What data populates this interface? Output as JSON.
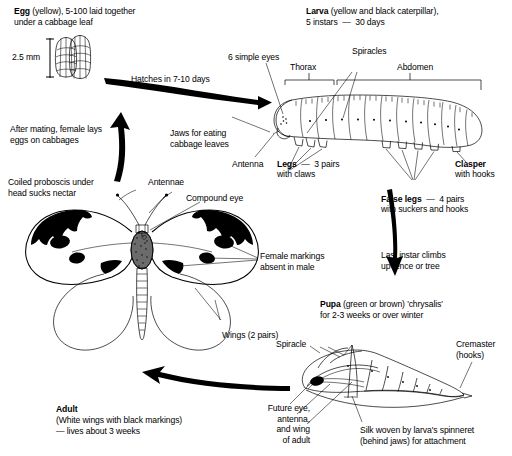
{
  "diagram": {
    "type": "labelled-biology-diagram",
    "ink_color": "#000000",
    "background_color": "#ffffff"
  },
  "stages": {
    "egg": {
      "heading": "Egg",
      "heading_rest": " (yellow), 5-100 laid together",
      "line2": "under a cabbage leaf",
      "scale_label": "2.5 mm"
    },
    "larva": {
      "heading": "Larva",
      "heading_rest": " (yellow and black caterpillar),",
      "line2": "5 instars  —  30 days"
    },
    "pupa": {
      "heading": "Pupa",
      "heading_rest": " (green or brown) 'chrysalis'",
      "line2": "for 2-3 weeks or over winter"
    },
    "adult": {
      "heading": "Adult",
      "line2": "(White wings with black markings)",
      "line3": "— lives about 3 weeks"
    }
  },
  "transitions": {
    "hatches": "Hatches in 7-10 days",
    "after_mating": "After mating, female lays\neggs on cabbages",
    "last_instar": "Last instar climbs\nup fence or tree"
  },
  "larva_labels": {
    "simple_eyes": "6 simple eyes",
    "thorax": "Thorax",
    "spiracles": "Spiracles",
    "abdomen": "Abdomen",
    "jaws": "Jaws for eating\ncabbage leaves",
    "antenna": "Antenna",
    "legs_bold": "Legs",
    "legs_rest": "  —  3 pairs",
    "legs_line2": "with claws",
    "false_legs_bold": "False legs",
    "false_legs_rest": "  —  4 pairs",
    "false_legs_line2": "with suckers and hooks",
    "clasper_bold": "Clasper",
    "clasper_line2": "with hooks"
  },
  "adult_labels": {
    "proboscis": "Coiled proboscis under\nhead sucks nectar",
    "antennae": "Antennae",
    "compound_eye": "Compound eye",
    "female_markings": "Female markings\nabsent in male",
    "wings": "Wings (2 pairs)"
  },
  "pupa_labels": {
    "spiracle": "Spiracle",
    "cremaster": "Cremaster",
    "cremaster_line2": "(hooks)",
    "future": "Future eye,\nantenna,\nand wing\nof adult",
    "silk": "Silk woven by larva's spinneret\n(behind jaws) for attachment"
  }
}
